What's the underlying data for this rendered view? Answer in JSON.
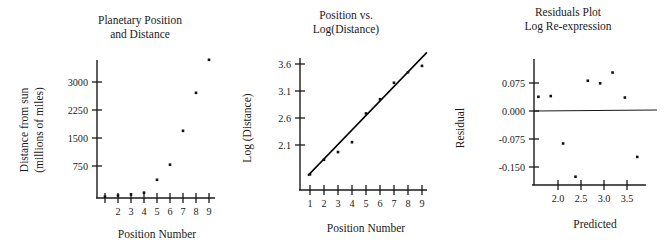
{
  "figure": {
    "name": "planetary-position-distance-panels",
    "panel_count": 3
  },
  "panel1": {
    "title_line1": "Planetary Position",
    "title_line2": "and Distance",
    "ylabel_line1": "Distance from sun",
    "ylabel_line2": "(millions of miles)",
    "xlabel": "Position Number",
    "yticks": [
      "750",
      "1500",
      "2250",
      "3000"
    ],
    "xticks": [
      "",
      "2",
      "3",
      "4",
      "5",
      "6",
      "7",
      "8",
      "9"
    ]
  },
  "panel2": {
    "title_line1": "Position vs.",
    "title_line2": "Log(Distance)",
    "ylabel": "Log (Distance)",
    "xlabel": "Position Number",
    "yticks": [
      "2.1",
      "2.6",
      "3.1",
      "3.6"
    ],
    "xticks": [
      "1",
      "2",
      "3",
      "4",
      "5",
      "6",
      "7",
      "8",
      "9"
    ]
  },
  "panel3": {
    "title_line1": "Residuals Plot",
    "title_line2": "Log Re-expression",
    "ylabel": "Residual",
    "xlabel": "Predicted",
    "yticks": [
      "-0.150",
      "-0.075",
      "0.000",
      "0.075"
    ],
    "xticks": [
      "2.0",
      "2.5",
      "3.0",
      "3.5"
    ]
  },
  "chart_data": [
    {
      "type": "scatter",
      "title": "Planetary Position and Distance",
      "xlabel": "Position Number",
      "ylabel": "Distance from sun (millions of miles)",
      "x": [
        1,
        2,
        3,
        4,
        5,
        6,
        7,
        8,
        9
      ],
      "y": [
        36,
        67,
        93,
        142,
        484,
        887,
        1787,
        2797,
        3675
      ],
      "xlim": [
        0.5,
        9.5
      ],
      "ylim": [
        0,
        3750
      ],
      "xticks": [
        2,
        3,
        4,
        5,
        6,
        7,
        8,
        9
      ],
      "yticks": [
        750,
        1500,
        2250,
        3000
      ],
      "grid": false,
      "legend": "none"
    },
    {
      "type": "scatter",
      "title": "Position vs. Log(Distance)",
      "xlabel": "Position Number",
      "ylabel": "Log (Distance)",
      "x": [
        1,
        2,
        3,
        4,
        5,
        6,
        7,
        8,
        9
      ],
      "y": [
        1.556,
        1.826,
        1.969,
        2.152,
        2.685,
        2.948,
        3.252,
        3.447,
        3.565
      ],
      "xlim": [
        0.5,
        9.5
      ],
      "ylim": [
        1.35,
        3.75
      ],
      "xticks": [
        1,
        2,
        3,
        4,
        5,
        6,
        7,
        8,
        9
      ],
      "yticks": [
        2.1,
        2.6,
        3.1,
        3.6
      ],
      "fit_line": {
        "type": "linear",
        "intercept": 1.305,
        "slope": 0.2685,
        "x_start": 0.85,
        "x_end": 9.35
      },
      "grid": false,
      "legend": "none"
    },
    {
      "type": "scatter",
      "title": "Residuals Plot Log Re-expression",
      "xlabel": "Predicted",
      "ylabel": "Residual",
      "x": [
        1.574,
        1.842,
        2.111,
        2.38,
        2.648,
        2.917,
        3.186,
        3.454,
        3.723
      ],
      "y": [
        0.038,
        0.04,
        -0.087,
        -0.176,
        0.081,
        0.074,
        0.103,
        0.036,
        -0.123
      ],
      "xlim": [
        1.45,
        3.9
      ],
      "ylim": [
        -0.2,
        0.125
      ],
      "xticks": [
        2.0,
        2.5,
        3.0,
        3.5
      ],
      "yticks": [
        -0.15,
        -0.075,
        0.0,
        0.075
      ],
      "zero_line": 0.0,
      "grid": false,
      "legend": "none"
    }
  ]
}
